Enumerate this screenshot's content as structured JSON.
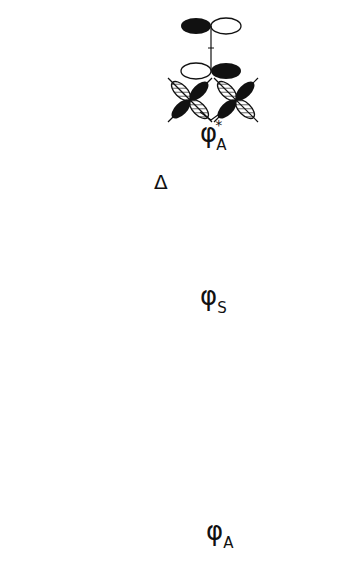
{
  "diagram": {
    "type": "molecular orbital energy-level diagram",
    "levels": [
      {
        "id": "psi_A_star",
        "symbol": "φ",
        "subscript": "A",
        "superscript": "*",
        "spin_arrow": "down",
        "position": "top"
      },
      {
        "id": "psi_S",
        "symbol": "φ",
        "subscript": "S",
        "spin_arrow": "down",
        "position": "middle"
      },
      {
        "id": "psi_A",
        "symbol": "φ",
        "subscript": "A",
        "spin_arrow": "up-pair",
        "position": "bottom"
      }
    ],
    "gap_label": "Δ",
    "left_fragment": {
      "description": "four crossed d-orbitals (metal fragments)",
      "arrows": [
        "up",
        "up"
      ]
    },
    "right_fragment": {
      "description": "bridging π orbital pair",
      "arrows": [
        "down",
        "up"
      ]
    },
    "caption_visible": "",
    "caption_note": "caption text cropped at bottom edge, illegible"
  },
  "colors": {
    "ink": "#111111",
    "background": "#ffffff"
  }
}
